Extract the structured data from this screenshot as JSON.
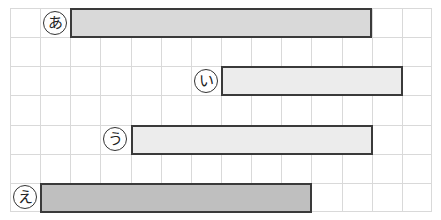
{
  "diagram": {
    "type": "horizontal-bar-grid",
    "grid": {
      "columns": 14,
      "rows": 7,
      "cell_width": 30.14,
      "cell_height": 29.14,
      "origin_x": 10,
      "origin_y": 8,
      "line_color": "#d9d9d9"
    },
    "bars": [
      {
        "label": "あ",
        "row": 0,
        "start_col": 2,
        "end_col": 12,
        "fill": "#d9d9d9"
      },
      {
        "label": "い",
        "row": 2,
        "start_col": 7,
        "end_col": 13,
        "fill": "#ececec"
      },
      {
        "label": "う",
        "row": 4,
        "start_col": 4,
        "end_col": 12,
        "fill": "#ececec"
      },
      {
        "label": "え",
        "row": 6,
        "start_col": 1,
        "end_col": 10,
        "fill": "#bfbfbf"
      }
    ]
  },
  "chart_data": {
    "type": "bar",
    "orientation": "horizontal",
    "categories": [
      "あ",
      "い",
      "う",
      "え"
    ],
    "values": [
      10,
      6,
      8,
      9
    ],
    "start": [
      2,
      7,
      4,
      1
    ],
    "end": [
      12,
      13,
      12,
      10
    ],
    "title": "",
    "xlabel": "",
    "ylabel": "",
    "xlim": [
      0,
      14
    ],
    "grid": true,
    "legend": false
  }
}
